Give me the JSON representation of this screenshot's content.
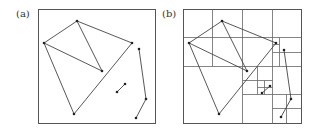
{
  "figure": {
    "panels": [
      {
        "id": "a",
        "label": "(a)",
        "description": "Set of line segments in a square bounding box",
        "box": {
          "x": 38,
          "y": 9,
          "w": 117,
          "h": 114
        },
        "polylines": [
          [
            [
              77,
              21
            ],
            [
              44,
              43
            ],
            [
              74,
              114
            ],
            [
              132,
              43
            ],
            [
              77,
              21
            ]
          ],
          [
            [
              77,
              21
            ],
            [
              102,
              71
            ],
            [
              44,
              43
            ]
          ],
          [
            [
              117,
              92
            ],
            [
              125,
              84
            ]
          ],
          [
            [
              139,
              49
            ],
            [
              146,
              99
            ],
            [
              136,
              118
            ]
          ]
        ],
        "points": [
          [
            77,
            21
          ],
          [
            44,
            43
          ],
          [
            132,
            43
          ],
          [
            102,
            71
          ],
          [
            74,
            114
          ],
          [
            117,
            92
          ],
          [
            125,
            84
          ],
          [
            139,
            49
          ],
          [
            146,
            99
          ],
          [
            136,
            118
          ]
        ]
      },
      {
        "id": "b",
        "label": "(b)",
        "description": "Same segments with quadtree subdivision of the bounding box",
        "box": {
          "x": 183,
          "y": 9,
          "w": 118,
          "h": 114
        },
        "grid_lines": [
          [
            [
              212,
              9
            ],
            [
              212,
              66
            ]
          ],
          [
            [
              242,
              9
            ],
            [
              242,
              123
            ]
          ],
          [
            [
              272,
              9
            ],
            [
              272,
              123
            ]
          ],
          [
            [
              183,
              37
            ],
            [
              301,
              37
            ]
          ],
          [
            [
              183,
              66
            ],
            [
              301,
              66
            ]
          ],
          [
            [
              242,
              94
            ],
            [
              301,
              94
            ]
          ],
          [
            [
              279,
              37
            ],
            [
              279,
              66
            ]
          ],
          [
            [
              272,
              44
            ],
            [
              279,
              44
            ]
          ],
          [
            [
              272,
              52
            ],
            [
              301,
              52
            ]
          ],
          [
            [
              257,
              66
            ],
            [
              257,
              94
            ]
          ],
          [
            [
              242,
              80
            ],
            [
              272,
              80
            ]
          ],
          [
            [
              264,
              80
            ],
            [
              264,
              94
            ]
          ],
          [
            [
              257,
              87
            ],
            [
              272,
              87
            ]
          ],
          [
            [
              286,
              94
            ],
            [
              286,
              123
            ]
          ],
          [
            [
              272,
              108
            ],
            [
              301,
              108
            ]
          ]
        ],
        "polylines": [
          [
            [
              222,
              21
            ],
            [
              189,
              43
            ],
            [
              219,
              114
            ],
            [
              276,
              43
            ],
            [
              222,
              21
            ]
          ],
          [
            [
              222,
              21
            ],
            [
              247,
              71
            ],
            [
              189,
              43
            ]
          ],
          [
            [
              262,
              93
            ],
            [
              270,
              86
            ]
          ],
          [
            [
              284,
              50
            ],
            [
              291,
              99
            ],
            [
              281,
              117
            ]
          ]
        ],
        "points": [
          [
            222,
            21
          ],
          [
            189,
            43
          ],
          [
            276,
            43
          ],
          [
            247,
            71
          ],
          [
            219,
            114
          ],
          [
            262,
            93
          ],
          [
            270,
            86
          ],
          [
            284,
            50
          ],
          [
            291,
            99
          ],
          [
            281,
            117
          ]
        ]
      }
    ],
    "colors": {
      "stroke": "#444444",
      "box": "#555555",
      "grid": "#666666",
      "point": "#222222"
    }
  }
}
